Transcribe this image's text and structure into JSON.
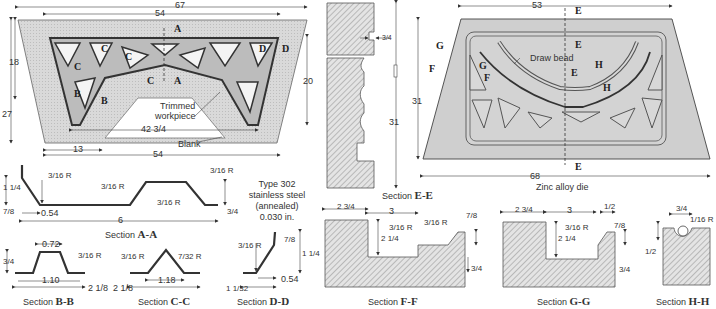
{
  "blank_view": {
    "dims": {
      "top_overall": "67",
      "top_inner": "54",
      "bottom": "54",
      "left_height": "27",
      "left_inner_height": "18",
      "right_height": "20",
      "bottom_inner": "42 3/4",
      "bottom_left": "13"
    },
    "labels": {
      "trimmed": "Trimmed",
      "workpiece": "workpiece",
      "blank": "Blank"
    },
    "section_markers": [
      "A",
      "A",
      "B",
      "B",
      "C",
      "C",
      "C",
      "C",
      "D",
      "D"
    ]
  },
  "section_aa": {
    "caption_prefix": "Section",
    "caption_id": "A-A",
    "dims": {
      "height": "1 1/4",
      "bottom_left": "7/8",
      "offset": "0.54",
      "width": "6",
      "right_height": "3/4",
      "radius_label": "3/16 R"
    }
  },
  "material_note": {
    "line1": "Type 302",
    "line2": "stainless steel",
    "line3": "(annealed)",
    "line4": "0.030 in."
  },
  "section_bb": {
    "caption_prefix": "Section",
    "caption_id": "B-B",
    "dims": {
      "top": "0.72",
      "height": "3/4",
      "base": "1.10",
      "width": "2 1/8",
      "radius": "3/16 R"
    }
  },
  "section_cc": {
    "caption_prefix": "Section",
    "caption_id": "C-C",
    "dims": {
      "radius_left": "3/16 R",
      "radius_top": "7/32 R",
      "base": "1.18",
      "width": "2 1/8"
    }
  },
  "section_dd": {
    "caption_prefix": "Section",
    "caption_id": "D-D",
    "dims": {
      "radius": "3/16 R",
      "top": "7/8",
      "height": "1 1/4",
      "offset": "0.54",
      "width": "1 1/32"
    }
  },
  "section_ee": {
    "caption_prefix": "Section",
    "caption_id": "E-E",
    "dims": {
      "notch": "3/4",
      "height": "31"
    }
  },
  "die_view": {
    "dims": {
      "top": "53",
      "bottom": "68",
      "height": "31"
    },
    "labels": {
      "draw_bead": "Draw bead",
      "caption": "Zinc alloy die"
    },
    "section_markers": [
      "E",
      "E",
      "E",
      "E",
      "F",
      "F",
      "G",
      "G",
      "H",
      "H"
    ]
  },
  "section_ff": {
    "caption_prefix": "Section",
    "caption_id": "F-F",
    "dims": {
      "left": "2 3/4",
      "middle": "3",
      "depth": "2 1/4",
      "r1": "3/16 R",
      "r2": "3/16 R",
      "top_right": "7/8",
      "bottom_right": "3/4"
    }
  },
  "section_gg": {
    "caption_prefix": "Section",
    "caption_id": "G-G",
    "dims": {
      "left": "2 3/4",
      "middle": "3",
      "top_right": "1/2",
      "depth": "2 1/4",
      "r1": "3/16 R",
      "mid_right": "7/8",
      "bottom_right": "3/4"
    }
  },
  "section_hh": {
    "caption_prefix": "Section",
    "caption_id": "H-H",
    "dims": {
      "top": "3/4",
      "radius": "1/16 R",
      "left": "1/2"
    }
  },
  "colors": {
    "line": "#333333",
    "blank_fill": "#d6d6d6",
    "die_fill": "#cfcfcf",
    "hatch": "#9a9a9a",
    "paper": "#ffffff"
  }
}
